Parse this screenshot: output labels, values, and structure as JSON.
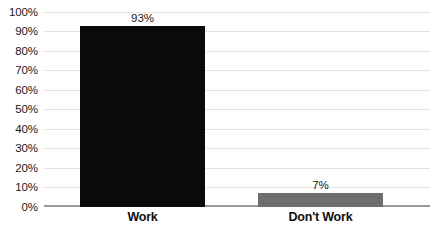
{
  "chart_data": {
    "type": "bar",
    "title": "",
    "subtitle": "",
    "xlabel": "",
    "ylabel": "",
    "categories": [
      "Work",
      "Don't Work"
    ],
    "values": [
      93,
      7
    ],
    "data_labels": [
      "93%",
      "7%"
    ],
    "bar_colors": [
      "#0a0a0a",
      "#6e6e6e"
    ],
    "ylim": [
      0,
      100
    ],
    "ytick_step": 10,
    "ytick_labels": [
      "100%",
      "90%",
      "80%",
      "70%",
      "60%",
      "50%",
      "40%",
      "30%",
      "20%",
      "10%",
      "0%"
    ],
    "ytick_values": [
      100,
      90,
      80,
      70,
      60,
      50,
      40,
      30,
      20,
      10,
      0
    ],
    "grid": true,
    "gridline_color": "#e2e2e2",
    "axis_line_color": "#9a9a9a",
    "legend": null,
    "legend_position": "none",
    "background_color": "#ffffff",
    "annotations": []
  }
}
